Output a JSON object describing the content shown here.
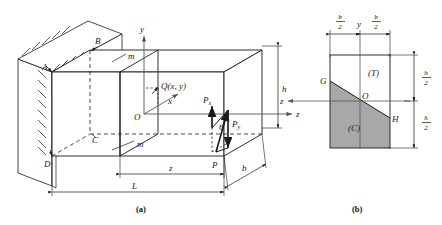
{
  "figure": {
    "captions": {
      "panel_a": "(a)",
      "panel_b": "(b)"
    },
    "colors": {
      "line": "#1a1a1a",
      "axis": "#555555",
      "compression_fill": "#a8a8a8",
      "background": "#ffffff"
    }
  },
  "panel_a": {
    "name": "cantilever-beam-3d",
    "vertices": [
      {
        "id": "A",
        "label": "A"
      },
      {
        "id": "B",
        "label": "B"
      },
      {
        "id": "C",
        "label": "C"
      },
      {
        "id": "D",
        "label": "D"
      },
      {
        "id": "O",
        "label": "O"
      }
    ],
    "axes": [
      {
        "id": "y",
        "label": "y",
        "direction": "up"
      },
      {
        "id": "x",
        "label": "x",
        "direction": "toward-viewer"
      },
      {
        "id": "z",
        "label": "z",
        "direction": "right-along-beam"
      }
    ],
    "point_q": {
      "label": "Q(x, y)"
    },
    "section_line": {
      "label_top": "m",
      "label_bottom": "m"
    },
    "forces": [
      {
        "id": "P",
        "label": "P",
        "description": "resultant inclined load at free end"
      },
      {
        "id": "Px",
        "label": "P",
        "subscript": "x",
        "description": "vertical component"
      },
      {
        "id": "Py",
        "label": "P",
        "subscript": "y",
        "description": "horizontal component"
      }
    ],
    "angle": {
      "label": "θ"
    },
    "dimensions": [
      {
        "id": "L",
        "label": "L",
        "description": "total beam length"
      },
      {
        "id": "z",
        "label": "z",
        "description": "distance from section m-m to free end"
      },
      {
        "id": "b",
        "label": "b",
        "description": "beam width"
      },
      {
        "id": "h",
        "label": "h",
        "description": "beam height"
      }
    ],
    "support": {
      "type": "fixed-wall",
      "hatching": true
    }
  },
  "panel_b": {
    "name": "cross-section",
    "zones": [
      {
        "id": "T",
        "label": "(T)",
        "description": "tension zone",
        "shaded": false
      },
      {
        "id": "C",
        "label": "(C)",
        "description": "compression zone",
        "shaded": true
      }
    ],
    "points": [
      {
        "id": "G",
        "label": "G"
      },
      {
        "id": "O",
        "label": "O"
      },
      {
        "id": "H",
        "label": "H"
      }
    ],
    "neutral_axis": {
      "from": "G",
      "to": "H"
    },
    "axes": [
      {
        "id": "y",
        "label": "y",
        "direction": "up"
      },
      {
        "id": "z",
        "label": "z",
        "direction": "left"
      }
    ],
    "dimensions": [
      {
        "id": "b-left",
        "num": "b",
        "den": "2"
      },
      {
        "id": "b-right",
        "num": "b",
        "den": "2"
      },
      {
        "id": "h-top",
        "num": "h",
        "den": "2"
      },
      {
        "id": "h-bottom",
        "num": "h",
        "den": "2"
      }
    ]
  }
}
